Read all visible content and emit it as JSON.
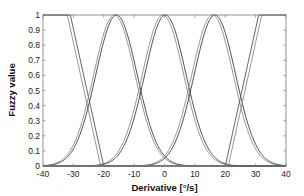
{
  "chart_data": {
    "type": "line",
    "title": "",
    "xlabel": "Derivative [°/s]",
    "ylabel": "Fuzzy value",
    "xlim": [
      -40,
      40
    ],
    "ylim": [
      0,
      1
    ],
    "xticks": [
      -40,
      -30,
      -20,
      -10,
      0,
      10,
      20,
      30,
      40
    ],
    "yticks": [
      0,
      0.1,
      0.2,
      0.3,
      0.4,
      0.5,
      0.6,
      0.7,
      0.8,
      0.9,
      1
    ],
    "xtick_labels": [
      "-40",
      "-30",
      "-20",
      "-10",
      "0",
      "10",
      "20",
      "30",
      "40"
    ],
    "ytick_labels": [
      "0",
      "0.1",
      "0.2",
      "0.3",
      "0.4",
      "0.5",
      "0.6",
      "0.7",
      "0.8",
      "0.9",
      "1"
    ],
    "grid": false,
    "legend": null,
    "series": [
      {
        "name": "NL (a)",
        "shape": "z-ramp",
        "x": [
          -40,
          -32,
          -21,
          40
        ],
        "y": [
          1,
          1,
          0,
          0
        ],
        "color": "#8a8a8a"
      },
      {
        "name": "NL (b)",
        "shape": "z-ramp",
        "x": [
          -40,
          -31,
          -20,
          40
        ],
        "y": [
          1,
          1,
          0,
          0
        ],
        "color": "#555555"
      },
      {
        "name": "NS (a)",
        "shape": "gaussian",
        "center": -16.5,
        "sigma": 6.8,
        "color": "#8a8a8a"
      },
      {
        "name": "NS (b)",
        "shape": "gaussian",
        "center": -15.8,
        "sigma": 6.8,
        "color": "#3a3a3a"
      },
      {
        "name": "Z (a)",
        "shape": "gaussian",
        "center": -0.5,
        "sigma": 6.8,
        "color": "#8a8a8a"
      },
      {
        "name": "Z (b)",
        "shape": "gaussian",
        "center": 0.3,
        "sigma": 6.8,
        "color": "#3a3a3a"
      },
      {
        "name": "PS (a)",
        "shape": "gaussian",
        "center": 15.8,
        "sigma": 6.8,
        "color": "#8a8a8a"
      },
      {
        "name": "PS (b)",
        "shape": "gaussian",
        "center": 16.6,
        "sigma": 6.8,
        "color": "#3a3a3a"
      },
      {
        "name": "PL (a)",
        "shape": "s-ramp",
        "x": [
          -40,
          20,
          31,
          40
        ],
        "y": [
          0,
          0,
          1,
          1
        ],
        "color": "#555555"
      },
      {
        "name": "PL (b)",
        "shape": "s-ramp",
        "x": [
          -40,
          21,
          32,
          40
        ],
        "y": [
          0,
          0,
          1,
          1
        ],
        "color": "#8a8a8a"
      }
    ]
  }
}
